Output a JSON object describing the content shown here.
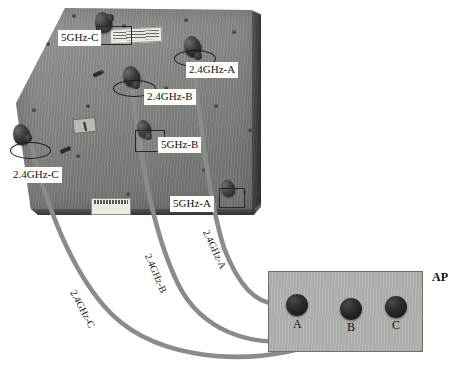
{
  "diagram": {
    "ap_label": "AP",
    "colors": {
      "panel": "#8e8e8c",
      "ap_box": "#b4b4b1",
      "cable": "#8a8a88",
      "connector": "#1b1b1a",
      "background": "#ffffff"
    }
  },
  "panel": {
    "connectors": [
      {
        "id": "5ghz-c",
        "label": "5GHz-C"
      },
      {
        "id": "2.4ghz-a",
        "label": "2.4GHz-A"
      },
      {
        "id": "2.4ghz-b",
        "label": "2.4GHz-B"
      },
      {
        "id": "5ghz-b",
        "label": "5GHz-B"
      },
      {
        "id": "2.4ghz-c",
        "label": "2.4GHz-C"
      },
      {
        "id": "5ghz-a",
        "label": "5GHz-A"
      }
    ]
  },
  "cables": [
    {
      "id": "cable-2.4ghz-a",
      "label": "2.4GHz-A",
      "from": "2.4GHz-A",
      "to": "A"
    },
    {
      "id": "cable-2.4ghz-b",
      "label": "2.4GHz-B",
      "from": "2.4GHz-B",
      "to": "B"
    },
    {
      "id": "cable-2.4ghz-c",
      "label": "2.4GHz-C",
      "from": "2.4GHz-C",
      "to": "C"
    }
  ],
  "ap": {
    "label": "AP",
    "ports": [
      {
        "id": "port-a",
        "label": "A"
      },
      {
        "id": "port-b",
        "label": "B"
      },
      {
        "id": "port-c",
        "label": "C"
      }
    ]
  }
}
